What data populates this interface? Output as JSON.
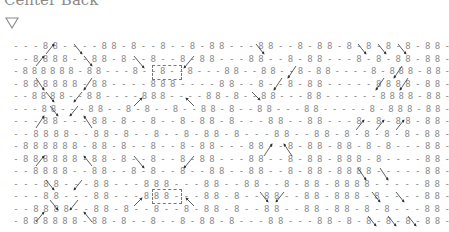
{
  "header": {
    "title": "Center Back",
    "filter_icon": "triangle-down-outline-icon"
  },
  "chart": {
    "symbol_stitch": "8",
    "symbol_purl": "-",
    "rows": [
      "---88----88-8--8--8-88---88--8-88-8-8-8-8-88-",
      "--8888--88-8--8--8-88---88--8-88---8-8-88-88-",
      "-888888-88---8--8--8---88--88--8-88----8-888-88-",
      "-888888-88----888----88--8--8-88-----8888-88-",
      "--8888--88----888----88-8--88---88------8888-88-",
      "---88---88--8-8--8--88-8--88---88-----8-888-88-",
      "---88---88-8--8--8-88-8---88--88---8-8-88-88-",
      "--8888--88-8--8--8-88-8---88--88-8-8-8-8-88-",
      "-888888-88-8--8--8-88---88--8-88-88-8-8---88-",
      "-888888-88-8--8--8-88---88--8-88-888-8----88-",
      "--8888--88--8-8--8--88--88--8-88-8888-----88-",
      "---88---88---888---88--88--8-88-8888-----88-",
      "---88---88---888---88-8--88--88-888-8----88-",
      "--8888--88-8--8--8-88-8--88--88-88-8-8---88-",
      "-888888-88-8--8--8-88-8---88---88-8-8-8-8-88-"
    ]
  }
}
